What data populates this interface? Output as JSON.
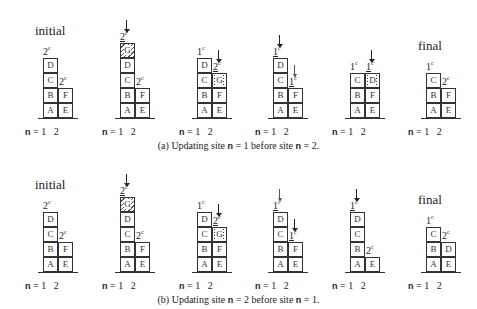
{
  "figure": {
    "rows": [
      {
        "caption_prefix": "(a)  Updating site ",
        "caption_mid": " = 1 before site ",
        "caption_end": " = 2.",
        "n_symbol": "n",
        "panels": [
          {
            "title": "initial"
          },
          {
            "title": ""
          },
          {
            "title": ""
          },
          {
            "title": ""
          },
          {
            "title": ""
          },
          {
            "title": "final"
          }
        ]
      },
      {
        "caption_prefix": "(b)  Updating site ",
        "caption_mid": " = 2 before site ",
        "caption_end": " = 1.",
        "n_symbol": "n",
        "panels": [
          {
            "title": "initial"
          },
          {
            "title": ""
          },
          {
            "title": ""
          },
          {
            "title": ""
          },
          {
            "title": ""
          },
          {
            "title": "final"
          }
        ]
      }
    ],
    "axis_label": {
      "n": "n",
      "eq": " = ",
      "site1": "1",
      "site2": "2"
    },
    "cells": {
      "A": "A",
      "B": "B",
      "C": "C",
      "D": "D",
      "E": "E",
      "F": "F",
      "G": "G"
    },
    "labels": {
      "one": "1",
      "two": "2",
      "c": "c"
    }
  }
}
